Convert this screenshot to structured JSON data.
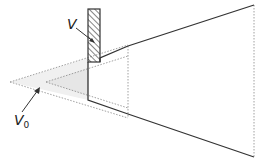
{
  "labels": {
    "v_label": "V",
    "v0_label_main": "V",
    "v0_label_sub": "0"
  },
  "colors": {
    "line": "#333333",
    "dotted": "#999999",
    "shade": "#eeeeee",
    "hatch": "#333333"
  }
}
